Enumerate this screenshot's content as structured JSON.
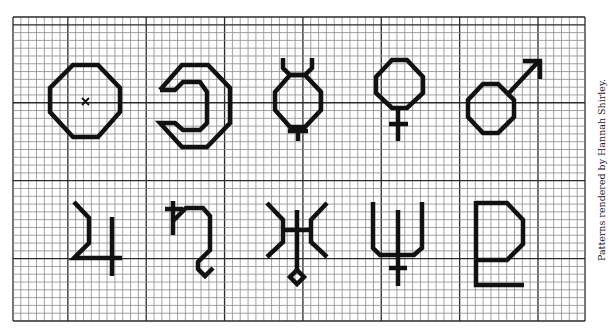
{
  "credit": "Patterns rendered by Hannah Shirley.",
  "colors": {
    "ink": "#111111",
    "minor_grid": "#8a8a8a",
    "major_grid": "#2a2a2a",
    "paper": "#ffffff"
  },
  "grid": {
    "columns": 73,
    "rows": 39,
    "major_every": 10
  },
  "symbols": [
    {
      "name": "Sun",
      "icon": "sun-symbol-icon",
      "row": 1,
      "col": 1
    },
    {
      "name": "Moon",
      "icon": "moon-symbol-icon",
      "row": 1,
      "col": 2
    },
    {
      "name": "Mercury",
      "icon": "mercury-symbol-icon",
      "row": 1,
      "col": 3
    },
    {
      "name": "Venus",
      "icon": "venus-symbol-icon",
      "row": 1,
      "col": 4
    },
    {
      "name": "Mars",
      "icon": "mars-symbol-icon",
      "row": 1,
      "col": 5
    },
    {
      "name": "Jupiter",
      "icon": "jupiter-symbol-icon",
      "row": 2,
      "col": 1
    },
    {
      "name": "Saturn",
      "icon": "saturn-symbol-icon",
      "row": 2,
      "col": 2
    },
    {
      "name": "Uranus",
      "icon": "uranus-symbol-icon",
      "row": 2,
      "col": 3
    },
    {
      "name": "Neptune",
      "icon": "neptune-symbol-icon",
      "row": 2,
      "col": 4
    },
    {
      "name": "Pluto",
      "icon": "pluto-symbol-icon",
      "row": 2,
      "col": 5
    }
  ]
}
